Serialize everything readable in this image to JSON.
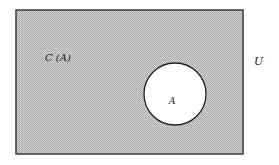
{
  "diagram": {
    "type": "venn",
    "universe_label": "U",
    "complement_label": "C (A)",
    "set_label": "A",
    "colors": {
      "shading": "#a9a9a9",
      "shading_light": "#d4d4d4",
      "border": "#3a3a3a",
      "set_fill": "#ffffff",
      "background": "#ffffff"
    }
  }
}
